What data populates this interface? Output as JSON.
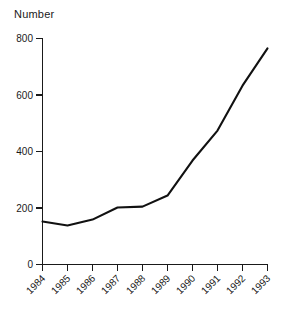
{
  "chart_data": {
    "type": "line",
    "title": "",
    "ylabel": "Number",
    "xlabel": "",
    "categories": [
      "1984",
      "1985",
      "1986",
      "1987",
      "1988",
      "1989",
      "1990",
      "1991",
      "1992",
      "1993"
    ],
    "values": [
      152,
      138,
      159,
      202,
      205,
      244,
      368,
      474,
      633,
      765
    ],
    "series": [
      {
        "name": "Number",
        "values": [
          152,
          138,
          159,
          202,
          205,
          244,
          368,
          474,
          633,
          765
        ]
      }
    ],
    "ylim": [
      0,
      800
    ],
    "yticks": [
      0,
      200,
      400,
      600,
      800
    ],
    "ytick_labels": [
      "0",
      "200",
      "400",
      "600",
      "800"
    ],
    "xtick_labels": [
      "1984",
      "1985",
      "1986",
      "1987",
      "1988",
      "1989",
      "1990",
      "1991",
      "1992",
      "1993"
    ],
    "grid": false,
    "legend": false,
    "legend_position": "none",
    "xtick_label_rotation": "-45",
    "line_color": "#111111",
    "axis_color": "#1a1a1a",
    "background_color": "#ffffff"
  },
  "axis": {
    "y_title": "Number"
  }
}
